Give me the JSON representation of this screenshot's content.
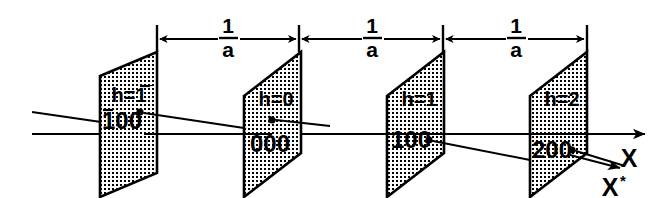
{
  "figure": {
    "background_color": "#ffffff",
    "ink_color": "#000000",
    "plane_fill": "stippled-dot-texture"
  },
  "dimensions": [
    {
      "id": "dim-1",
      "numerator": "1",
      "denominator": "a",
      "label": "1/a"
    },
    {
      "id": "dim-2",
      "numerator": "1",
      "denominator": "a",
      "label": "1/a"
    },
    {
      "id": "dim-3",
      "numerator": "1",
      "denominator": "a",
      "label": "1/a"
    }
  ],
  "planes": [
    {
      "id": "plane-1",
      "h_label_prefix": "h=",
      "h_value": "1",
      "h_overbar": true,
      "h_label": "h=1̅",
      "index": "100",
      "index_overbar": true,
      "index_label": "1̅ 0 0"
    },
    {
      "id": "plane-2",
      "h_label_prefix": "h=",
      "h_value": "0",
      "h_overbar": false,
      "h_label": "h=0",
      "index": "000",
      "index_overbar": false,
      "index_label": "000"
    },
    {
      "id": "plane-3",
      "h_label_prefix": "h=",
      "h_value": "1",
      "h_overbar": false,
      "h_label": "h=1",
      "index": "100",
      "index_overbar": false,
      "index_label": "100"
    },
    {
      "id": "plane-4",
      "h_label_prefix": "h=",
      "h_value": "2",
      "h_overbar": false,
      "h_label": "h=2",
      "index": "200",
      "index_overbar": false,
      "index_label": "200"
    }
  ],
  "axes": [
    {
      "id": "axis-x",
      "label": "X",
      "star": ""
    },
    {
      "id": "axis-x-star",
      "label": "X",
      "star": "*"
    }
  ]
}
